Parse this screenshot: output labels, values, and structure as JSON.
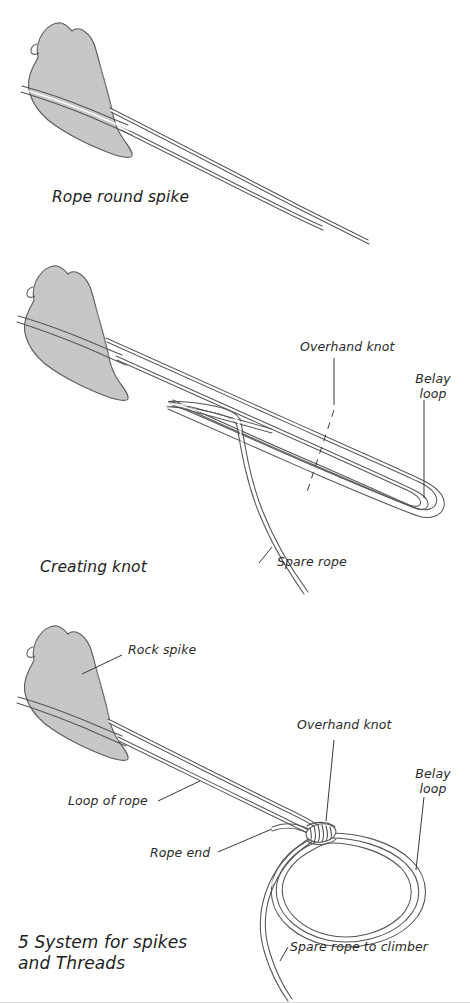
{
  "figure": {
    "caption_number": "5",
    "title_line1": "5 System for spikes",
    "title_line2": "and Threads"
  },
  "colors": {
    "rock_fill": "#c9c9c9",
    "rock_stroke": "#5a5a5a",
    "rope_stroke": "#555555",
    "rope_highlight": "#ffffff",
    "text": "#2b2b2b",
    "leader_line": "#3a3a3a",
    "background": "#ffffff"
  },
  "panels": [
    {
      "id": "rope-round-spike",
      "caption": "Rope round spike",
      "labels": []
    },
    {
      "id": "creating-knot",
      "caption": "Creating knot",
      "labels": [
        {
          "id": "overhand-knot",
          "text": "Overhand knot"
        },
        {
          "id": "belay-loop",
          "text": "Belay\nloop",
          "line1": "Belay",
          "line2": "loop"
        },
        {
          "id": "spare-rope",
          "text": "Spare rope"
        }
      ]
    },
    {
      "id": "system-for-spikes",
      "caption": "5 System for spikes and Threads",
      "labels": [
        {
          "id": "rock-spike",
          "text": "Rock spike"
        },
        {
          "id": "overhand-knot",
          "text": "Overhand knot"
        },
        {
          "id": "belay-loop",
          "text": "Belay\nloop",
          "line1": "Belay",
          "line2": "loop"
        },
        {
          "id": "loop-of-rope",
          "text": "Loop of rope"
        },
        {
          "id": "rope-end",
          "text": "Rope end"
        },
        {
          "id": "spare-rope-to-climber",
          "text": "Spare rope to climber"
        }
      ]
    }
  ]
}
